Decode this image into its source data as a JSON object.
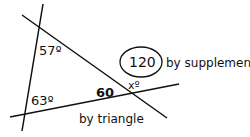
{
  "diagram": {
    "angles": {
      "top_left": "57º",
      "bottom_left": "63º",
      "interior_right": "60",
      "unknown": "xº"
    },
    "circled_value": "120",
    "annotations": {
      "supplement": "by supplement",
      "triangle": "by triangle"
    },
    "colors": {
      "stroke": "#111111",
      "background": "#ffffff"
    }
  }
}
